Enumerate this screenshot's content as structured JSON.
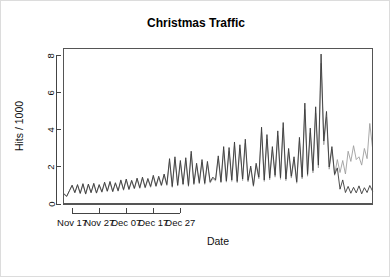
{
  "chart_data": {
    "type": "line",
    "title": "Christmas Traffic",
    "xlabel": "Date",
    "ylabel": "Hits / 1000",
    "grid": false,
    "legend": "none",
    "ylim": [
      0,
      8.4
    ],
    "yticks": [
      0,
      2,
      4,
      6,
      8
    ],
    "ytick_labels": [
      "0",
      "2",
      "4",
      "6",
      "8"
    ],
    "xlim": [
      0,
      55
    ],
    "xticks": [
      3,
      13,
      23,
      33,
      43
    ],
    "xtick_labels": [
      "Nov 17",
      "Nov 27",
      "Dec 07",
      "Dec 17",
      "Dec 27"
    ],
    "x": [
      0,
      1,
      2,
      3,
      4,
      5,
      6,
      7,
      8,
      9,
      10,
      11,
      12,
      13,
      14,
      15,
      16,
      17,
      18,
      19,
      20,
      21,
      22,
      23,
      24,
      25,
      26,
      27,
      28,
      29,
      30,
      31,
      32,
      33,
      34,
      35,
      36,
      37,
      38,
      39,
      40,
      41,
      42,
      43,
      44,
      45,
      46,
      47,
      48,
      49,
      50,
      51,
      52,
      53,
      54,
      55
    ],
    "series": [
      {
        "name": "total-hits",
        "color": "#3a3a3a",
        "width": 0.9,
        "values": [
          0.55,
          0.42,
          0.72,
          1.02,
          0.62,
          1.05,
          0.58,
          1.1,
          0.55,
          1.08,
          0.62,
          1.12,
          0.6,
          1.05,
          0.66,
          1.18,
          0.7,
          1.22,
          0.68,
          1.15,
          0.72,
          1.3,
          0.78,
          1.35,
          0.8,
          1.28,
          0.85,
          1.4,
          0.88,
          1.45,
          0.9,
          1.38,
          0.95,
          1.55,
          0.98,
          1.5,
          1.02,
          1.62,
          1.05,
          2.45,
          0.95,
          2.55,
          1.02,
          2.35,
          1.08,
          2.5,
          1.0,
          2.85,
          1.1,
          2.2,
          1.15,
          2.4,
          1.12,
          2.3,
          1.2,
          1.45
        ]
      },
      {
        "name": "unique-visitors",
        "color": "#9e9e9e",
        "width": 0.9,
        "values": [
          0.52,
          0.4,
          0.7,
          0.98,
          0.6,
          1.0,
          0.56,
          1.05,
          0.53,
          1.02,
          0.6,
          1.06,
          0.58,
          1.0,
          0.63,
          1.12,
          0.67,
          1.16,
          0.65,
          1.1,
          0.69,
          1.24,
          0.74,
          1.28,
          0.76,
          1.22,
          0.81,
          1.33,
          0.84,
          1.38,
          0.86,
          1.31,
          0.9,
          1.47,
          0.93,
          1.42,
          0.97,
          1.54,
          1.0,
          2.3,
          0.9,
          2.4,
          0.97,
          2.22,
          1.02,
          2.36,
          0.95,
          2.7,
          1.04,
          2.08,
          1.09,
          2.26,
          1.06,
          2.17,
          1.13,
          1.38
        ]
      }
    ],
    "phase2": {
      "description": "second half of record, shown as extension of same two series",
      "x": [
        55,
        56,
        57,
        58,
        59,
        60,
        61,
        62,
        63,
        64,
        65,
        66,
        67,
        68,
        69,
        70,
        71,
        72,
        73,
        74,
        75,
        76,
        77,
        78,
        79,
        80,
        81,
        82,
        83,
        84,
        85,
        86,
        87,
        88,
        89,
        90,
        91,
        92,
        93,
        94,
        95,
        96,
        97,
        98,
        99,
        100,
        101,
        102,
        103,
        104,
        105,
        106,
        107,
        108,
        109,
        110,
        111,
        112,
        113,
        114
      ],
      "dark": [
        1.45,
        1.3,
        2.6,
        1.2,
        3.1,
        1.25,
        3.05,
        1.3,
        3.35,
        1.22,
        3.2,
        1.35,
        3.5,
        1.28,
        2.05,
        1.0,
        2.2,
        1.45,
        4.15,
        1.3,
        3.75,
        1.4,
        3.1,
        1.55,
        3.95,
        1.42,
        4.4,
        1.35,
        3.0,
        1.5,
        2.55,
        1.2,
        3.6,
        1.45,
        5.45,
        1.6,
        4.1,
        1.8,
        5.25,
        2.1,
        8.1,
        3.4,
        5.0,
        2.0,
        3.1,
        1.6,
        1.95,
        0.8,
        1.3,
        0.62,
        0.95,
        0.58,
        0.9,
        0.6,
        0.98,
        0.55,
        0.88,
        0.62,
        1.0,
        0.7
      ],
      "light": [
        1.38,
        1.25,
        2.45,
        1.15,
        2.9,
        1.18,
        2.85,
        1.22,
        3.15,
        1.15,
        3.0,
        1.26,
        3.28,
        1.2,
        1.95,
        0.95,
        2.08,
        1.36,
        3.9,
        1.22,
        3.52,
        1.3,
        2.92,
        1.45,
        3.7,
        1.33,
        4.12,
        1.26,
        2.82,
        1.4,
        2.4,
        1.12,
        3.38,
        1.36,
        5.1,
        1.5,
        3.85,
        1.68,
        4.9,
        1.95,
        7.6,
        3.2,
        4.7,
        1.88,
        2.95,
        1.55,
        2.4,
        1.7,
        2.35,
        1.62,
        2.85,
        2.3,
        3.15,
        2.4,
        2.55,
        2.1,
        3.0,
        2.45,
        4.35,
        3.05
      ]
    }
  }
}
